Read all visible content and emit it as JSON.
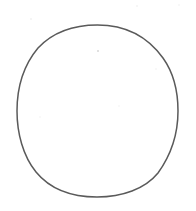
{
  "canvas": {
    "width": 196,
    "height": 211,
    "background_color": "#ffffff",
    "description": "Scanned hand-drawn circle outline on blank white paper"
  },
  "figure": {
    "name": "hand-drawn circle",
    "shape_type": "ellipse-outline",
    "filled": false,
    "fill_color": "#ffffff",
    "stroke_color": "#5a5a5a",
    "stroke_width_px": 1.5,
    "center_x": 97.5,
    "center_y": 111,
    "radius_x": 80,
    "radius_y": 86,
    "bounds": {
      "left": 17,
      "top": 25,
      "right": 178,
      "bottom": 197,
      "width": 161,
      "height": 172
    },
    "path": "M 97.5 25 C 131 25 150 40 163 58 C 173 72 178 92 178 111 C 178 133 171 155 158 173 C 145 189 122 197 97 197 C 72 197 50 189 36 172 C 23 156 17 133 17 111 C 17 89 23 66 38 48 C 53 32 72 25 97.5 25 Z"
  },
  "artifacts": {
    "specks": [
      {
        "name": "speck-center-top",
        "x": 98,
        "y": 51,
        "size": 2.2,
        "color": "#c9c9c9",
        "opacity": 0.75
      },
      {
        "name": "speck-upper-left",
        "x": 31,
        "y": 19,
        "size": 1.6,
        "color": "#ededed",
        "opacity": 0.7
      },
      {
        "name": "speck-upper-right",
        "x": 137,
        "y": 6,
        "size": 1.6,
        "color": "#ededed",
        "opacity": 0.6
      },
      {
        "name": "speck-top-right-corner",
        "x": 179,
        "y": 5,
        "size": 1.4,
        "color": "#f0f0f0",
        "opacity": 0.6
      },
      {
        "name": "speck-mid-right",
        "x": 156,
        "y": 69,
        "size": 1.5,
        "color": "#f0f0f0",
        "opacity": 0.55
      },
      {
        "name": "speck-mid-center",
        "x": 119,
        "y": 106,
        "size": 1.5,
        "color": "#f1f1f1",
        "opacity": 0.5
      },
      {
        "name": "speck-lower-left",
        "x": 40,
        "y": 117,
        "size": 1.4,
        "color": "#f2f2f2",
        "opacity": 0.5
      }
    ]
  }
}
